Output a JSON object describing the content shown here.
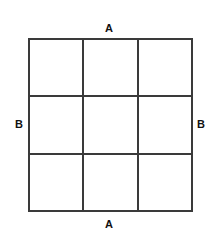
{
  "figure": {
    "name": "labeled-three-by-three-grid",
    "background_color": "#ffffff",
    "line_color": "#3a3a3a",
    "text_color": "#111111",
    "grid": {
      "rows": 3,
      "columns": 3,
      "cell_count": 9,
      "cells": [
        {
          "id": "r1c1",
          "text": ""
        },
        {
          "id": "r1c2",
          "text": ""
        },
        {
          "id": "r1c3",
          "text": ""
        },
        {
          "id": "r2c1",
          "text": ""
        },
        {
          "id": "r2c2",
          "text": ""
        },
        {
          "id": "r2c3",
          "text": ""
        },
        {
          "id": "r3c1",
          "text": ""
        },
        {
          "id": "r3c2",
          "text": ""
        },
        {
          "id": "r3c3",
          "text": ""
        }
      ]
    },
    "labels": {
      "top": "A",
      "bottom": "A",
      "left": "B",
      "right": "B"
    }
  }
}
